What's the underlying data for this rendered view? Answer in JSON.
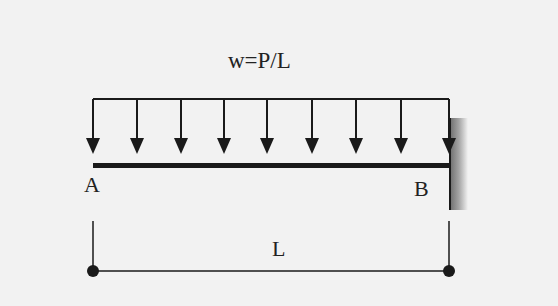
{
  "diagram": {
    "load_label": "w=P/L",
    "left_support": "A",
    "right_support": "B",
    "span_label": "L",
    "colors": {
      "line": "#1a1a1a",
      "background": "#f2f2f2",
      "wall": "#8a8a8a"
    },
    "arrow_count": 9
  }
}
